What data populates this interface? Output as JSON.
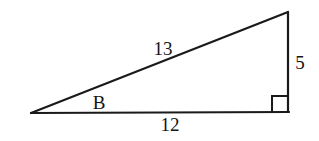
{
  "figure": {
    "type": "right-triangle-diagram",
    "labels": {
      "hypotenuse": "13",
      "vertical_side": "5",
      "base": "12",
      "angle": "B"
    },
    "colors": {
      "line": "#1a1a1a",
      "text": "#141414",
      "background": "#ffffff"
    }
  }
}
